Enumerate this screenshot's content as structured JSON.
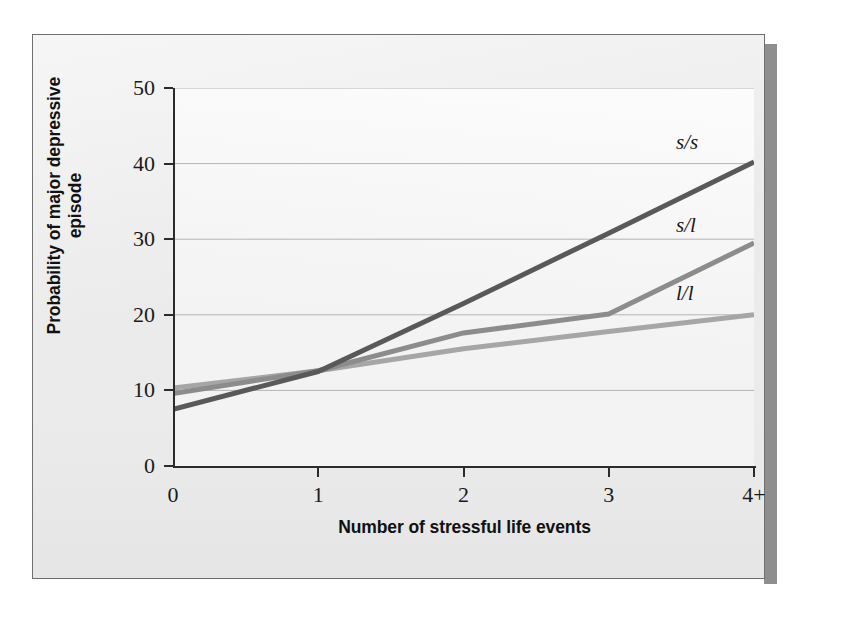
{
  "figure": {
    "panel_bg": "#ebebeb",
    "plot_bg": "#f2f2f2",
    "border_color": "#6f6f6f",
    "shadow_color": "#8e8e8e"
  },
  "axes": {
    "y_title": "Probability of major depressive episode",
    "x_title": "Number of stressful life events",
    "y_ticks": [
      "0",
      "10",
      "20",
      "30",
      "40",
      "50"
    ],
    "x_ticks": [
      "0",
      "1",
      "2",
      "3",
      "4+"
    ]
  },
  "chart_data": {
    "type": "line",
    "title": "",
    "subtitle": "",
    "xlabel": "Number of stressful life events",
    "ylabel": "Probability of major depressive episode",
    "xlim": [
      0,
      4
    ],
    "ylim": [
      0,
      50
    ],
    "ytick_values": [
      0,
      10,
      20,
      30,
      40,
      50
    ],
    "xtick_values": [
      0,
      1,
      2,
      3,
      4
    ],
    "xtick_labels": [
      "0",
      "1",
      "2",
      "3",
      "4+"
    ],
    "grid": "horizontal",
    "legend": "inline-right-labels",
    "x": [
      0,
      1,
      2,
      3,
      4
    ],
    "series": [
      {
        "name": "s/s",
        "label": "s/s",
        "color": "#595959",
        "width": 5,
        "values": [
          7.5,
          12.5,
          21.5,
          30.8,
          40.2
        ]
      },
      {
        "name": "s/l",
        "label": "s/l",
        "color": "#8c8c8c",
        "width": 5,
        "values": [
          9.6,
          12.6,
          17.6,
          20.1,
          29.5
        ]
      },
      {
        "name": "l/l",
        "label": "l/l",
        "color": "#a6a6a6",
        "width": 5,
        "values": [
          10.3,
          12.6,
          15.5,
          17.8,
          20.0
        ]
      }
    ],
    "annotations": [
      {
        "text": "s/s",
        "x": 4,
        "y": 40.2
      },
      {
        "text": "s/l",
        "x": 4,
        "y": 29.5
      },
      {
        "text": "l/l",
        "x": 4,
        "y": 20.0
      }
    ]
  }
}
